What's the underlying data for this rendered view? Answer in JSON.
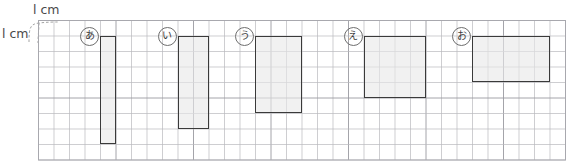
{
  "page": {
    "background_color": "#ffffff"
  },
  "annotations": {
    "unit_top_label": "l cm",
    "unit_left_label": "l cm",
    "unit_top_name": "one-centimetre-horizontal",
    "unit_left_name": "one-centimetre-vertical",
    "brace_color": "#9a9a9a"
  },
  "grid": {
    "cell_px": 15.5,
    "cols": 34,
    "rows": 9,
    "origin_x": 38,
    "origin_y": 20,
    "line_color": "#b9b9bd",
    "major_line_color": "#9a9aa0",
    "border_color": "#a8a8ae",
    "major_every": 5
  },
  "chart_data": {
    "type": "bar",
    "xlabel": "width (cm)",
    "ylabel": "height (cm)",
    "categories": [
      "あ",
      "い",
      "う",
      "え",
      "お"
    ],
    "series": [
      {
        "name": "width_cm",
        "values": [
          1,
          2,
          3,
          4,
          5
        ]
      },
      {
        "name": "height_cm",
        "values": [
          7,
          6,
          5,
          4,
          3
        ]
      },
      {
        "name": "area_cm2",
        "values": [
          7,
          12,
          15,
          16,
          15
        ]
      }
    ],
    "grid": true,
    "legend": "none"
  },
  "figures": [
    {
      "id": "rect-a",
      "label": "あ",
      "col": 4,
      "row": 1,
      "width_cells": 1,
      "height_cells": 7,
      "width_cm": 1,
      "height_cm": 7,
      "area_cm2": 7,
      "fill": "#e8e8e8",
      "stroke": "#3a3a3a"
    },
    {
      "id": "rect-i",
      "label": "い",
      "col": 9,
      "row": 1,
      "width_cells": 2,
      "height_cells": 6,
      "width_cm": 2,
      "height_cm": 6,
      "area_cm2": 12,
      "fill": "#e8e8e8",
      "stroke": "#3a3a3a"
    },
    {
      "id": "rect-u",
      "label": "う",
      "col": 14,
      "row": 1,
      "width_cells": 3,
      "height_cells": 5,
      "width_cm": 3,
      "height_cm": 5,
      "area_cm2": 15,
      "fill": "#e8e8e8",
      "stroke": "#3a3a3a"
    },
    {
      "id": "rect-e",
      "label": "え",
      "col": 21,
      "row": 1,
      "width_cells": 4,
      "height_cells": 4,
      "width_cm": 4,
      "height_cm": 4,
      "area_cm2": 16,
      "fill": "#e8e8e8",
      "stroke": "#3a3a3a"
    },
    {
      "id": "rect-o",
      "label": "お",
      "col": 28,
      "row": 1,
      "width_cells": 5,
      "height_cells": 3,
      "width_cm": 5,
      "height_cm": 3,
      "area_cm2": 15,
      "fill": "#e8e8e8",
      "stroke": "#3a3a3a"
    }
  ]
}
